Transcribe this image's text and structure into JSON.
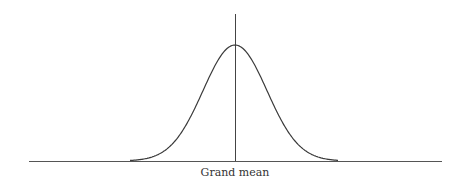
{
  "diagram": {
    "type": "normal-distribution-curve",
    "x_label": "Grand mean",
    "colors": {
      "line": "#3a3a3a",
      "background": "#ffffff"
    },
    "geometry": {
      "baseline": {
        "x1": 29,
        "x2": 442,
        "y": 161
      },
      "mean_line": {
        "x": 235,
        "y_top": 14,
        "y_bottom": 161
      },
      "curve": {
        "center_x": 235,
        "peak_y": 45,
        "base_y": 161,
        "sigma_px": 32,
        "left_x": 130,
        "right_x": 338
      }
    }
  }
}
